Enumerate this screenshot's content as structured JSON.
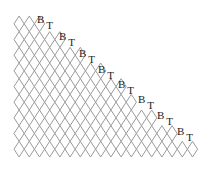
{
  "diagram": {
    "type": "triangular-diamond-lattice",
    "line_color": "#9a9a9a",
    "rows": 9,
    "row_diamond_counts": [
      3,
      5,
      7,
      9,
      11,
      12,
      14,
      16,
      18
    ],
    "labels": [
      {
        "b": "B",
        "t": "T",
        "x": 37,
        "y": 14
      },
      {
        "b": "B",
        "t": "T",
        "x": 59,
        "y": 31
      },
      {
        "b": "B",
        "t": "T",
        "x": 79,
        "y": 48
      },
      {
        "b": "B",
        "t": "T",
        "x": 98,
        "y": 64
      },
      {
        "b": "B",
        "t": "T",
        "x": 118,
        "y": 79
      },
      {
        "b": "B",
        "t": "T",
        "x": 138,
        "y": 94
      },
      {
        "b": "B",
        "t": "T",
        "x": 157,
        "y": 110
      },
      {
        "b": "B",
        "t": "T",
        "x": 177,
        "y": 126
      }
    ]
  }
}
